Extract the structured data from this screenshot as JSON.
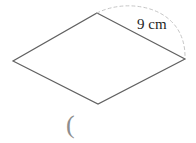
{
  "diagram": {
    "type": "geometry-figure",
    "shape": "rhombus",
    "measurement_label": "9 cm",
    "measured_side": "top-right side (top vertex to right vertex)",
    "caption_fragment": "(",
    "rhombus_points": "97,13 185,59 98,104 13,61",
    "arc_path": "M 97 13 C 128 -3 186 6 185 58",
    "label_pos": {
      "x": "137",
      "y": "29"
    },
    "caption_pos": {
      "x": "66",
      "y": "133"
    },
    "colors": {
      "background": "#ffffff",
      "shape_stroke": "#616161",
      "arc_stroke": "#c6c6c6",
      "label_text": "#1f1f1f",
      "caption_text": "#8d8d8d"
    }
  }
}
